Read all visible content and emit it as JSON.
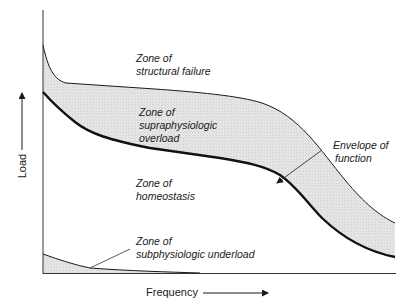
{
  "diagram": {
    "type": "load-frequency envelope diagram",
    "axes": {
      "x_label": "Frequency",
      "y_label": "Load"
    },
    "zones": [
      {
        "id": "structural",
        "line1": "Zone of",
        "line2": "structural failure"
      },
      {
        "id": "supraphysiologic",
        "line1": "Zone of",
        "line2": "supraphysiologic",
        "line3": "overload"
      },
      {
        "id": "homeostasis",
        "line1": "Zone of",
        "line2": "homeostasis"
      },
      {
        "id": "subphysiologic",
        "line1": "Zone of",
        "line2": "subphysiologic underload"
      }
    ],
    "annotation": {
      "line1": "Envelope of",
      "line2": "function"
    },
    "colors": {
      "line": "#1a1a1a",
      "fill": "#e2e2e2",
      "background": "#ffffff"
    }
  }
}
